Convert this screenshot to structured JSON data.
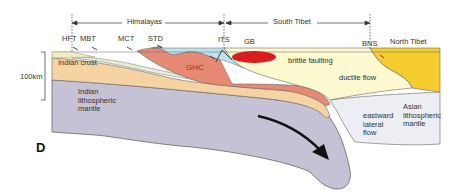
{
  "figure": {
    "panel_label": "D",
    "scale_label": "100km",
    "regions": [
      {
        "name": "Himalayas"
      },
      {
        "name": "South Tibet"
      }
    ],
    "fault_labels": [
      "HFT",
      "MBT",
      "MCT",
      "STD",
      "ITS",
      "BNS"
    ],
    "top_labels": {
      "gb": "GB",
      "north_tibet": "North Tibet"
    },
    "layer_labels": {
      "indian_crust": "Indian crust",
      "ghc": "GHC",
      "brittle": "brittle faulting",
      "ductile": "ductile flow",
      "indian_mantle": "Indian\nlithospheric\nmantle",
      "asian_mantle": "Asian\nlithospheric\nmantle",
      "eastward_flow": "eastward\nlateral\nflow"
    },
    "colors": {
      "indian_mantle": "#c5c2d6",
      "indian_crust": "#f6d3a3",
      "ghc": "#e68a76",
      "lesser_himalaya": "#e6efd6",
      "tethyan": "#bfe1ea",
      "tibet_crust": "#fcf8cf",
      "north_tibet": "#f5cd2e",
      "asian_mantle": "#eceef4",
      "gb": "#d81e1e"
    }
  }
}
